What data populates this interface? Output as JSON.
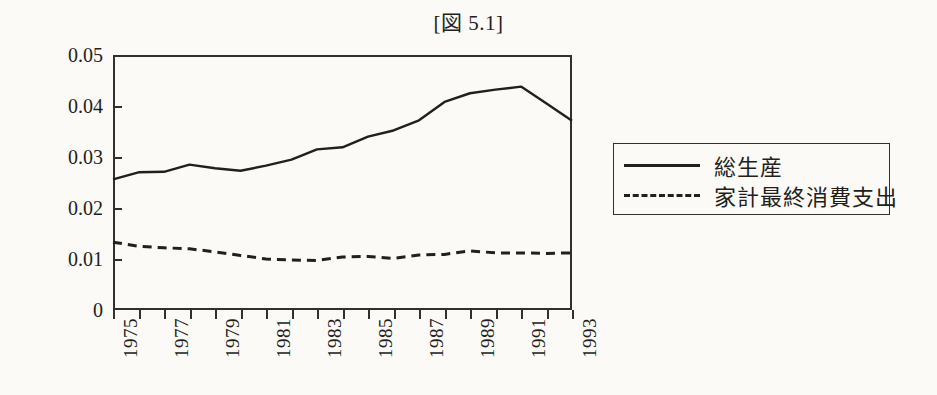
{
  "figure": {
    "title": "[図 5.1]"
  },
  "legend": {
    "position": "right",
    "entries": [
      {
        "label": "総生産",
        "style": "solid"
      },
      {
        "label": "家計最終消費支出",
        "style": "dashed"
      }
    ]
  },
  "axes": {
    "y_tick_labels": [
      "0.05",
      "0.04",
      "0.03",
      "0.02",
      "0.01",
      "0"
    ],
    "x_tick_labels": [
      "1975",
      "1977",
      "1979",
      "1981",
      "1983",
      "1985",
      "1987",
      "1989",
      "1991",
      "1993"
    ]
  },
  "chart_data": {
    "type": "line",
    "title": "[図 5.1]",
    "xlabel": "",
    "ylabel": "",
    "x": [
      1975,
      1976,
      1977,
      1978,
      1979,
      1980,
      1981,
      1982,
      1983,
      1984,
      1985,
      1986,
      1987,
      1988,
      1989,
      1990,
      1991,
      1992,
      1993
    ],
    "xlim": [
      1975,
      1993
    ],
    "ylim": [
      0,
      0.05
    ],
    "yticks": [
      0,
      0.01,
      0.02,
      0.03,
      0.04,
      0.05
    ],
    "xticks": [
      1975,
      1976,
      1977,
      1978,
      1979,
      1980,
      1981,
      1982,
      1983,
      1984,
      1985,
      1986,
      1987,
      1988,
      1989,
      1990,
      1991,
      1992,
      1993
    ],
    "xtick_labels_shown": [
      1975,
      1977,
      1979,
      1981,
      1983,
      1985,
      1987,
      1989,
      1991,
      1993
    ],
    "grid": false,
    "legend_position": "right",
    "series": [
      {
        "name": "総生産",
        "style": "solid",
        "color": "#231f1c",
        "values": [
          0.0256,
          0.027,
          0.0271,
          0.0285,
          0.0278,
          0.0273,
          0.0283,
          0.0295,
          0.0315,
          0.0319,
          0.034,
          0.0352,
          0.0372,
          0.0408,
          0.0425,
          0.0432,
          0.0438,
          0.0405,
          0.0371
        ]
      },
      {
        "name": "家計最終消費支出",
        "style": "dashed",
        "color": "#231f1c",
        "values": [
          0.0133,
          0.0125,
          0.0122,
          0.012,
          0.0114,
          0.0107,
          0.01,
          0.0098,
          0.0097,
          0.0104,
          0.0105,
          0.0101,
          0.0108,
          0.0109,
          0.0116,
          0.0112,
          0.0112,
          0.0111,
          0.0112
        ]
      }
    ]
  }
}
